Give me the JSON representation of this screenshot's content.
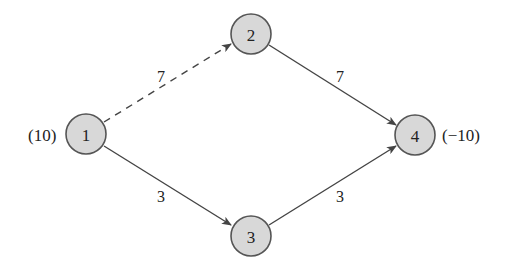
{
  "diagram": {
    "type": "network-flow",
    "nodes": [
      {
        "id": "1",
        "label": "1",
        "supply": "(10)",
        "cx": 86,
        "cy": 134
      },
      {
        "id": "2",
        "label": "2",
        "supply": "",
        "cx": 251,
        "cy": 34
      },
      {
        "id": "3",
        "label": "3",
        "supply": "",
        "cx": 251,
        "cy": 236
      },
      {
        "id": "4",
        "label": "4",
        "supply": "(−10)",
        "cx": 415,
        "cy": 135
      }
    ],
    "edges": [
      {
        "from": "1",
        "to": "2",
        "label": "7",
        "style": "dashed"
      },
      {
        "from": "2",
        "to": "4",
        "label": "7",
        "style": "solid"
      },
      {
        "from": "1",
        "to": "3",
        "label": "3",
        "style": "solid"
      },
      {
        "from": "3",
        "to": "4",
        "label": "3",
        "style": "solid"
      }
    ],
    "colors": {
      "node_fill": "#d8d8d8",
      "node_stroke": "#555555",
      "edge": "#444444",
      "text": "#222222"
    }
  }
}
